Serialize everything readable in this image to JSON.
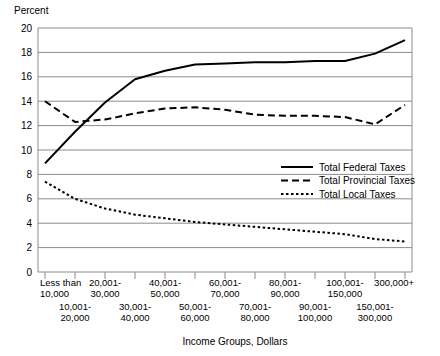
{
  "chart_data": {
    "type": "line",
    "title": "",
    "ylabel": "Percent",
    "xlabel": "Income Groups, Dollars",
    "ylim": [
      0,
      20
    ],
    "ytick_step": 2,
    "yticks": [
      "0",
      "2",
      "4",
      "6",
      "8",
      "10",
      "12",
      "14",
      "16",
      "18",
      "20"
    ],
    "grid": true,
    "legend_position": "inside-right-middle",
    "categories": [
      "Less than 10,000",
      "10,001-20,000",
      "20,001-30,000",
      "30,001-40,000",
      "40,001-50,000",
      "50,001-60,000",
      "60,001-70,000",
      "70,001-80,000",
      "80,001-90,000",
      "90,001-100,000",
      "100,001-150,000",
      "150,001-300,000",
      "300,000+"
    ],
    "xtick_labels_row1": [
      "Less than",
      "",
      "20,001-",
      "",
      "40,001-",
      "",
      "60,001-",
      "",
      "80,001-",
      "",
      "100,001-",
      "",
      "300,000+"
    ],
    "xtick_labels_row2": [
      "10,000",
      "",
      "30,000",
      "",
      "50,000",
      "",
      "70,000",
      "",
      "90,000",
      "",
      "150,000",
      "",
      ""
    ],
    "xtick_labels_row3": [
      "",
      "10,001-",
      "",
      "30,001-",
      "",
      "50,001-",
      "",
      "70,001-",
      "",
      "90,001-",
      "",
      "150,001-",
      ""
    ],
    "xtick_labels_row4": [
      "",
      "20,000",
      "",
      "40,000",
      "",
      "60,000",
      "",
      "80,000",
      "",
      "100,000",
      "",
      "300,000",
      ""
    ],
    "series": [
      {
        "name": "Total Federal Taxes",
        "style": "solid",
        "color": "#000000",
        "values": [
          8.9,
          11.5,
          13.9,
          15.8,
          16.5,
          17.0,
          17.1,
          17.2,
          17.2,
          17.3,
          17.3,
          17.9,
          19.0
        ]
      },
      {
        "name": "Total Provincial Taxes",
        "style": "dashed",
        "color": "#000000",
        "values": [
          14.0,
          12.3,
          12.5,
          13.0,
          13.4,
          13.5,
          13.3,
          12.9,
          12.8,
          12.8,
          12.7,
          12.1,
          13.7
        ]
      },
      {
        "name": "Total Local Taxes",
        "style": "dotted",
        "color": "#000000",
        "values": [
          7.4,
          6.0,
          5.2,
          4.7,
          4.4,
          4.1,
          3.9,
          3.7,
          3.5,
          3.3,
          3.1,
          2.7,
          2.5
        ]
      }
    ],
    "legend": [
      {
        "label": "Total Federal Taxes",
        "style": "solid"
      },
      {
        "label": "Total Provincial Taxes",
        "style": "dashed"
      },
      {
        "label": "Total Local Taxes",
        "style": "dotted"
      }
    ]
  }
}
